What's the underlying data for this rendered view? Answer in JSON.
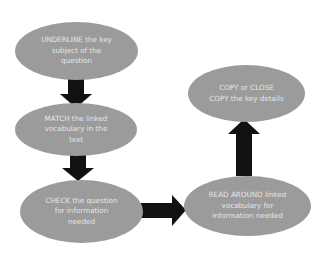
{
  "diagram": {
    "type": "flowchart",
    "colors": {
      "node_fill": "#9b9b9b",
      "node_text": "#e6e6e6",
      "arrow": "#111111",
      "background": "#ffffff"
    },
    "nodes": [
      {
        "id": "underline",
        "label": "UNDERLINE the key\nsubject of the\nquestion"
      },
      {
        "id": "match",
        "label": "MATCH the linked\nvocabulary in the\ntext"
      },
      {
        "id": "check",
        "label": "CHECK the question\nfor information\nneeded"
      },
      {
        "id": "read_around",
        "label": "READ AROUND linked\nvocabulary for\ninformation needed"
      },
      {
        "id": "copy",
        "label": "COPY or CLOSE\nCOPY the key details"
      }
    ],
    "edges": [
      {
        "from": "underline",
        "to": "match",
        "direction": "down"
      },
      {
        "from": "match",
        "to": "check",
        "direction": "down"
      },
      {
        "from": "check",
        "to": "read_around",
        "direction": "right"
      },
      {
        "from": "read_around",
        "to": "copy",
        "direction": "up"
      }
    ]
  }
}
